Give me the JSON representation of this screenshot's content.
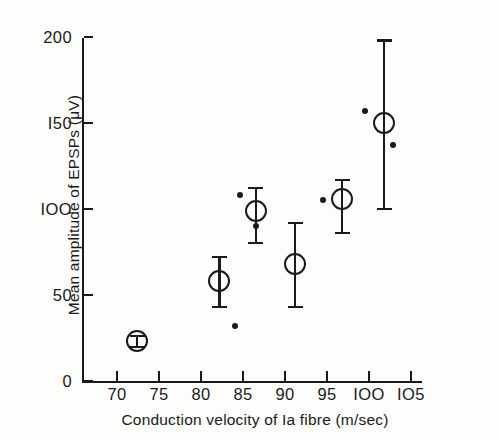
{
  "chart_data": {
    "type": "scatter",
    "title": "",
    "xlabel": "Conduction velocity of Ia fibre (m/sec)",
    "ylabel": "Mean amplitude of EPSPs (μV)",
    "xlim": [
      66,
      107
    ],
    "ylim": [
      0,
      205
    ],
    "grid": false,
    "legend": null,
    "xticks": [
      70,
      75,
      80,
      85,
      90,
      95,
      100,
      105
    ],
    "xtick_labels": [
      "70",
      "75",
      "80",
      "85",
      "90",
      "95",
      "IOO",
      "IO5"
    ],
    "yticks": [
      0,
      50,
      100,
      150,
      200
    ],
    "ytick_labels": [
      "0",
      "50",
      "IOO",
      "I50",
      "200"
    ],
    "series": [
      {
        "name": "Group means with S.E. bars",
        "marker": "open-circle",
        "points": [
          {
            "x": 72.4,
            "y": 23,
            "err_low": 20,
            "err_high": 26
          },
          {
            "x": 82.2,
            "y": 58,
            "err_low": 43,
            "err_high": 72
          },
          {
            "x": 86.5,
            "y": 99,
            "err_low": 80,
            "err_high": 112
          },
          {
            "x": 91.2,
            "y": 68,
            "err_low": 43,
            "err_high": 92
          },
          {
            "x": 96.8,
            "y": 106,
            "err_low": 86,
            "err_high": 117
          },
          {
            "x": 101.8,
            "y": 150,
            "err_low": 100,
            "err_high": 198
          }
        ]
      },
      {
        "name": "Individual observations",
        "marker": "filled-dot",
        "points": [
          {
            "x": 84.0,
            "y": 32
          },
          {
            "x": 84.6,
            "y": 108
          },
          {
            "x": 86.5,
            "y": 90
          },
          {
            "x": 94.5,
            "y": 105
          },
          {
            "x": 99.5,
            "y": 157
          },
          {
            "x": 102.8,
            "y": 137
          }
        ]
      }
    ]
  },
  "axes": {
    "y_title": "Mean amplitude of EPSPs (μV)",
    "x_title": "Conduction velocity of Ia fibre (m/sec)"
  },
  "colors": {
    "ink": "#1a1a1a",
    "background": "#fdfdfc"
  }
}
